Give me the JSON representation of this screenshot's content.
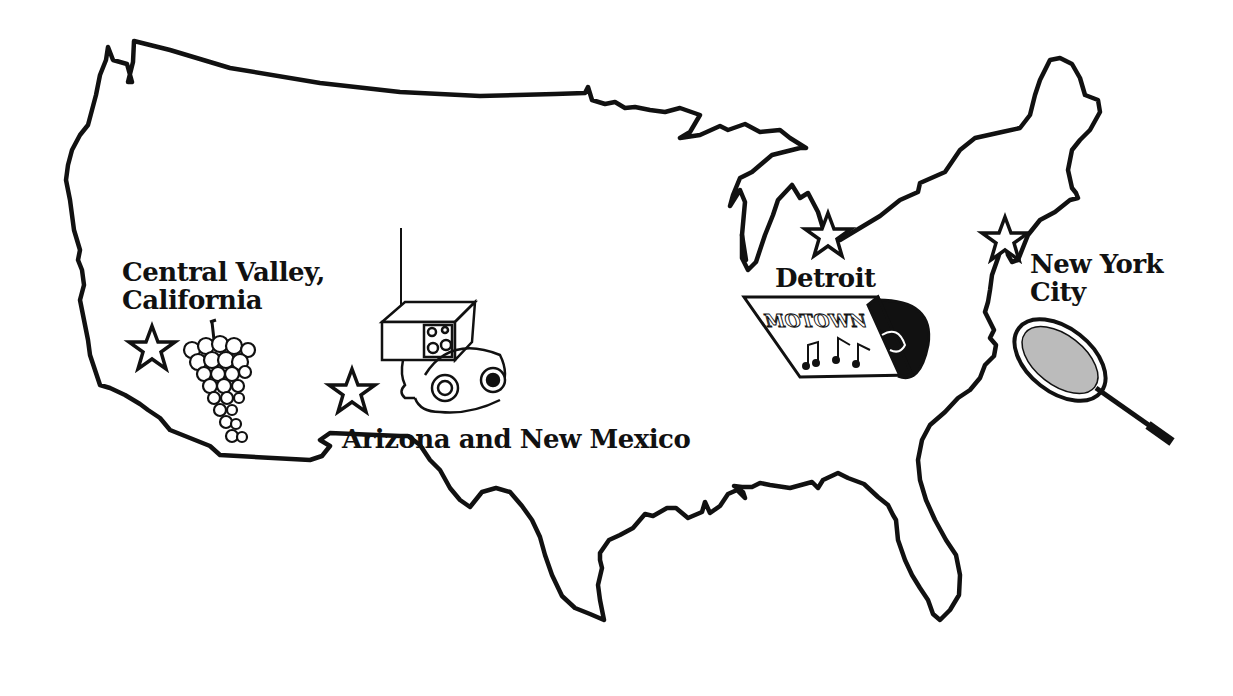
{
  "map": {
    "title": "United States map with highlighted regions",
    "outline_color": "#111111",
    "background": "#ffffff"
  },
  "locations": [
    {
      "id": "central-valley",
      "name_line1": "Central Valley,",
      "name_line2": "California",
      "icon": "grapes-icon",
      "marker": "star-icon"
    },
    {
      "id": "arizona-new-mexico",
      "name_line1": "Arizona and New Mexico",
      "icon": "radio-headphones-icon",
      "marker": "star-icon"
    },
    {
      "id": "detroit",
      "name_line1": "Detroit",
      "icon": "motown-record-icon",
      "marker": "star-icon",
      "record_label_text": "MOTOWN"
    },
    {
      "id": "new-york-city",
      "name_line1": "New York",
      "name_line2": "City",
      "icon": "tennis-racket-icon",
      "marker": "star-icon"
    }
  ]
}
